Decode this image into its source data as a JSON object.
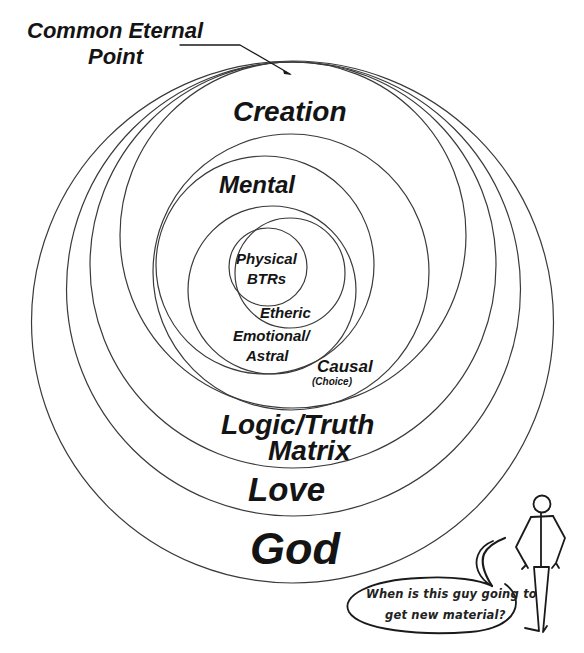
{
  "diagram": {
    "pointer_label": {
      "line1": "Common Eternal",
      "line2": "Point"
    },
    "rings": [
      {
        "id": "god",
        "cx": 292.5,
        "cy": 322,
        "r": 261
      },
      {
        "id": "love",
        "cx": 293.5,
        "cy": 289,
        "r": 227
      },
      {
        "id": "logic",
        "cx": 293,
        "cy": 265,
        "r": 203
      },
      {
        "id": "creation",
        "cx": 293,
        "cy": 235,
        "r": 173
      },
      {
        "id": "causal",
        "cx": 291,
        "cy": 272,
        "r": 138
      },
      {
        "id": "mental",
        "cx": 265,
        "cy": 265,
        "r": 109
      },
      {
        "id": "emotional",
        "cx": 272,
        "cy": 290,
        "r": 84
      },
      {
        "id": "etheric",
        "cx": 290,
        "cy": 273,
        "r": 55
      },
      {
        "id": "physical",
        "cx": 268,
        "cy": 267,
        "r": 39
      }
    ],
    "labels": {
      "creation": "Creation",
      "mental": "Mental",
      "physical_line1": "Physical",
      "physical_line2": "BTRs",
      "etheric": "Etheric",
      "emotional_line1": "Emotional/",
      "emotional_line2": "Astral",
      "causal": "Causal",
      "causal_sub": "(Choice)",
      "logic_line1": "Logic/Truth",
      "logic_line2": "Matrix",
      "love": "Love",
      "god": "God"
    }
  },
  "cartoon": {
    "figure": "stick-figure",
    "speech_bubble": {
      "line1": "When is this guy going to",
      "line2": "get new material?"
    }
  },
  "colors": {
    "background": "#ffffff",
    "ink": "#141414",
    "ring_stroke": "#3a3a3a"
  }
}
